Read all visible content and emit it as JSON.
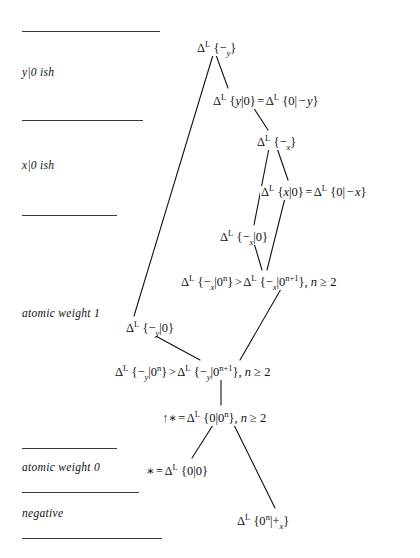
{
  "figure": {
    "type": "hasse-diagram",
    "title": "",
    "background": "#ffffff",
    "ink_color": "#111111",
    "width": 420,
    "height": 558
  },
  "region_labels": [
    {
      "id": "y0ish",
      "text": "y|0 ish",
      "x": 22,
      "y": 66
    },
    {
      "id": "x0ish",
      "text": "x|0 ish",
      "x": 22,
      "y": 159
    },
    {
      "id": "atomic-weight-1",
      "text": "atomic weight 1",
      "x": 22,
      "y": 307
    },
    {
      "id": "atomic-weight-0",
      "text": "atomic weight 0",
      "x": 22,
      "y": 461
    },
    {
      "id": "negative",
      "text": "negative",
      "x": 22,
      "y": 507
    }
  ],
  "divider_rules": [
    {
      "id": "rule-top",
      "x": 22,
      "y": 31,
      "width": 138
    },
    {
      "id": "rule-y-x",
      "x": 22,
      "y": 120,
      "width": 121
    },
    {
      "id": "rule-x-aw1",
      "x": 22,
      "y": 215,
      "width": 95
    },
    {
      "id": "rule-aw1-aw0",
      "x": 22,
      "y": 448,
      "width": 95
    },
    {
      "id": "rule-aw0-neg",
      "x": 22,
      "y": 492,
      "width": 117
    },
    {
      "id": "rule-bottom",
      "x": 22,
      "y": 538,
      "width": 140
    }
  ],
  "nodes": [
    {
      "id": "n-minus-y",
      "x": 196,
      "y": 42,
      "parts": [
        {
          "t": "sym",
          "v": "Δ"
        },
        {
          "t": "sup",
          "v": "L"
        },
        {
          "t": "txt",
          "v": " {"
        },
        {
          "t": "sym",
          "v": "−"
        },
        {
          "t": "sub",
          "v": "y"
        },
        {
          "t": "txt",
          "v": "}"
        }
      ],
      "plain": "Δ^L {−_y}"
    },
    {
      "id": "n-y0",
      "x": 212,
      "y": 95,
      "parts": [
        {
          "t": "sym",
          "v": "Δ"
        },
        {
          "t": "sup",
          "v": "L"
        },
        {
          "t": "txt",
          "v": " {"
        },
        {
          "t": "mi",
          "v": "y"
        },
        {
          "t": "txt",
          "v": "|0}"
        },
        {
          "t": "op",
          "v": "="
        },
        {
          "t": "sym",
          "v": "Δ"
        },
        {
          "t": "sup",
          "v": "L"
        },
        {
          "t": "txt",
          "v": " {0|"
        },
        {
          "t": "op",
          "v": "−"
        },
        {
          "t": "mi",
          "v": "y"
        },
        {
          "t": "txt",
          "v": "}"
        }
      ],
      "plain": "Δ^L {y|0} = Δ^L {0| − y}"
    },
    {
      "id": "n-minus-x",
      "x": 256,
      "y": 136,
      "parts": [
        {
          "t": "sym",
          "v": "Δ"
        },
        {
          "t": "sup",
          "v": "L"
        },
        {
          "t": "txt",
          "v": " {"
        },
        {
          "t": "sym",
          "v": "−"
        },
        {
          "t": "sub",
          "v": "x"
        },
        {
          "t": "txt",
          "v": "}"
        }
      ],
      "plain": "Δ^L {−_x}"
    },
    {
      "id": "n-x0",
      "x": 260,
      "y": 186,
      "parts": [
        {
          "t": "sym",
          "v": "Δ"
        },
        {
          "t": "sup",
          "v": "L"
        },
        {
          "t": "txt",
          "v": " {"
        },
        {
          "t": "mi",
          "v": "x"
        },
        {
          "t": "txt",
          "v": "|0}"
        },
        {
          "t": "op",
          "v": "="
        },
        {
          "t": "sym",
          "v": "Δ"
        },
        {
          "t": "sup",
          "v": "L"
        },
        {
          "t": "txt",
          "v": " {0|"
        },
        {
          "t": "op",
          "v": "−"
        },
        {
          "t": "mi",
          "v": "x"
        },
        {
          "t": "txt",
          "v": "}"
        }
      ],
      "plain": "Δ^L {x|0} = Δ^L {0| − x}"
    },
    {
      "id": "n-minus-x-0",
      "x": 219,
      "y": 231,
      "parts": [
        {
          "t": "sym",
          "v": "Δ"
        },
        {
          "t": "sup",
          "v": "L"
        },
        {
          "t": "txt",
          "v": " {"
        },
        {
          "t": "sym",
          "v": "−"
        },
        {
          "t": "sub",
          "v": "x"
        },
        {
          "t": "txt",
          "v": "|0}"
        }
      ],
      "plain": "Δ^L {−_x|0}"
    },
    {
      "id": "n-minus-x-ineq",
      "x": 180,
      "y": 276,
      "parts": [
        {
          "t": "sym",
          "v": "Δ"
        },
        {
          "t": "sup",
          "v": "L"
        },
        {
          "t": "txt",
          "v": " {"
        },
        {
          "t": "sym",
          "v": "−"
        },
        {
          "t": "sub",
          "v": "x"
        },
        {
          "t": "txt",
          "v": "|0"
        },
        {
          "t": "sup",
          "v": "n"
        },
        {
          "t": "txt",
          "v": "}"
        },
        {
          "t": "op",
          "v": ">"
        },
        {
          "t": "sym",
          "v": "Δ"
        },
        {
          "t": "sup",
          "v": "L"
        },
        {
          "t": "txt",
          "v": " {"
        },
        {
          "t": "sym",
          "v": "−"
        },
        {
          "t": "sub",
          "v": "x"
        },
        {
          "t": "txt",
          "v": "|0"
        },
        {
          "t": "sup",
          "v": "n+1"
        },
        {
          "t": "txt",
          "v": "}, "
        },
        {
          "t": "mi",
          "v": "n"
        },
        {
          "t": "txt",
          "v": " ≥ 2"
        }
      ],
      "plain": "Δ^L {−_x|0^n} > Δ^L {−_x|0^{n+1}}, n ≥ 2"
    },
    {
      "id": "n-minus-y-0",
      "x": 125,
      "y": 322,
      "parts": [
        {
          "t": "sym",
          "v": "Δ"
        },
        {
          "t": "sup",
          "v": "L"
        },
        {
          "t": "txt",
          "v": " {"
        },
        {
          "t": "sym",
          "v": "−"
        },
        {
          "t": "sub",
          "v": "y"
        },
        {
          "t": "txt",
          "v": "|0}"
        }
      ],
      "plain": "Δ^L {−_y|0}"
    },
    {
      "id": "n-minus-y-ineq",
      "x": 114,
      "y": 366,
      "parts": [
        {
          "t": "sym",
          "v": "Δ"
        },
        {
          "t": "sup",
          "v": "L"
        },
        {
          "t": "txt",
          "v": " {"
        },
        {
          "t": "sym",
          "v": "−"
        },
        {
          "t": "sub",
          "v": "y"
        },
        {
          "t": "txt",
          "v": "|0"
        },
        {
          "t": "sup",
          "v": "n"
        },
        {
          "t": "txt",
          "v": "}"
        },
        {
          "t": "op",
          "v": ">"
        },
        {
          "t": "sym",
          "v": "Δ"
        },
        {
          "t": "sup",
          "v": "L"
        },
        {
          "t": "txt",
          "v": " {"
        },
        {
          "t": "sym",
          "v": "−"
        },
        {
          "t": "sub",
          "v": "y"
        },
        {
          "t": "txt",
          "v": "|0"
        },
        {
          "t": "sup",
          "v": "n+1"
        },
        {
          "t": "txt",
          "v": "}, "
        },
        {
          "t": "mi",
          "v": "n"
        },
        {
          "t": "txt",
          "v": " ≥ 2"
        }
      ],
      "plain": "Δ^L {−_y|0^n} > Δ^L {−_y|0^{n+1}}, n ≥ 2"
    },
    {
      "id": "n-up-star",
      "x": 161,
      "y": 412,
      "parts": [
        {
          "t": "txt",
          "v": "↑∗"
        },
        {
          "t": "op",
          "v": "="
        },
        {
          "t": "sym",
          "v": "Δ"
        },
        {
          "t": "sup",
          "v": "L"
        },
        {
          "t": "txt",
          "v": " {0|0"
        },
        {
          "t": "sup",
          "v": "n"
        },
        {
          "t": "txt",
          "v": "}, "
        },
        {
          "t": "mi",
          "v": "n"
        },
        {
          "t": "txt",
          "v": " ≥ 2"
        }
      ],
      "plain": "↑∗ = Δ^L {0|0^n}, n ≥ 2"
    },
    {
      "id": "n-star",
      "x": 145,
      "y": 465,
      "parts": [
        {
          "t": "txt",
          "v": "∗"
        },
        {
          "t": "op",
          "v": "="
        },
        {
          "t": "sym",
          "v": "Δ"
        },
        {
          "t": "sup",
          "v": "L"
        },
        {
          "t": "txt",
          "v": " {0|0}"
        }
      ],
      "plain": "∗ = Δ^L {0|0}"
    },
    {
      "id": "n-plus-x",
      "x": 236,
      "y": 515,
      "parts": [
        {
          "t": "sym",
          "v": "Δ"
        },
        {
          "t": "sup",
          "v": "L"
        },
        {
          "t": "txt",
          "v": " {0"
        },
        {
          "t": "sup",
          "v": "n"
        },
        {
          "t": "txt",
          "v": "|"
        },
        {
          "t": "sym",
          "v": "+"
        },
        {
          "t": "sub",
          "v": "x"
        },
        {
          "t": "txt",
          "v": "}"
        }
      ],
      "plain": "Δ^L {0^n|+_x}"
    }
  ],
  "edges": [
    {
      "id": "e-minusy-to-y0",
      "from": "n-minus-y",
      "to": "n-y0",
      "x1": 216,
      "y1": 55,
      "x2": 228,
      "y2": 88
    },
    {
      "id": "e-minusy-to-minusy0",
      "from": "n-minus-y",
      "to": "n-minus-y-0",
      "x1": 213,
      "y1": 55,
      "x2": 134,
      "y2": 316
    },
    {
      "id": "e-y0-to-minusx",
      "from": "n-y0",
      "to": "n-minus-x",
      "x1": 253,
      "y1": 107,
      "x2": 268,
      "y2": 130
    },
    {
      "id": "e-minusx-to-x0",
      "from": "n-minus-x",
      "to": "n-x0",
      "x1": 277,
      "y1": 148,
      "x2": 288,
      "y2": 180
    },
    {
      "id": "e-minusx-to-minusx0",
      "from": "n-minus-x",
      "to": "n-minus-x-0",
      "x1": 269,
      "y1": 148,
      "x2": 254,
      "y2": 225
    },
    {
      "id": "e-x0-to-ineqx",
      "from": "n-x0",
      "to": "n-minus-x-ineq",
      "x1": 285,
      "y1": 198,
      "x2": 267,
      "y2": 270
    },
    {
      "id": "e-minusx0-to-ineqx",
      "from": "n-minus-x-0",
      "to": "n-minus-x-ineq",
      "x1": 254,
      "y1": 243,
      "x2": 262,
      "y2": 270
    },
    {
      "id": "e-ineqx-to-ineqy",
      "from": "n-minus-x-ineq",
      "to": "n-minus-y-ineq",
      "x1": 281,
      "y1": 289,
      "x2": 240,
      "y2": 360
    },
    {
      "id": "e-minusy0-to-ineqy",
      "from": "n-minus-y-0",
      "to": "n-minus-y-ineq",
      "x1": 152,
      "y1": 334,
      "x2": 200,
      "y2": 360
    },
    {
      "id": "e-ineqy-to-upstar",
      "from": "n-minus-y-ineq",
      "to": "n-up-star",
      "x1": 221,
      "y1": 379,
      "x2": 221,
      "y2": 405
    },
    {
      "id": "e-upstar-to-star",
      "from": "n-up-star",
      "to": "n-star",
      "x1": 213,
      "y1": 425,
      "x2": 192,
      "y2": 458
    },
    {
      "id": "e-upstar-to-plusx",
      "from": "n-up-star",
      "to": "n-plus-x",
      "x1": 234,
      "y1": 425,
      "x2": 275,
      "y2": 508
    }
  ]
}
